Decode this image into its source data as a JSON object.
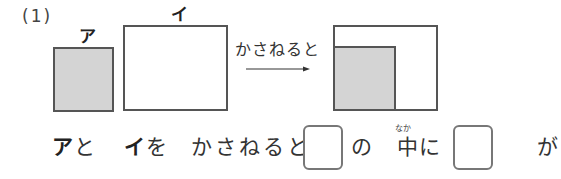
{
  "problem": {
    "number": "(1)",
    "shapes": {
      "a": {
        "label": "ア",
        "fill": "#d4d4d4"
      },
      "i": {
        "label": "イ",
        "fill": "#ffffff"
      }
    },
    "caption": "かさねると",
    "sentence": {
      "part1_label": "ア",
      "part1_particle": "と",
      "part2_label": "イ",
      "part2_particle": "を",
      "part3": "かさねると,",
      "part4": "の",
      "part5_kanji": "中",
      "part5_ruby": "なか",
      "part5_particle": "に",
      "part6": "が"
    },
    "answer_boxes": [
      {
        "value": ""
      },
      {
        "value": ""
      }
    ]
  }
}
